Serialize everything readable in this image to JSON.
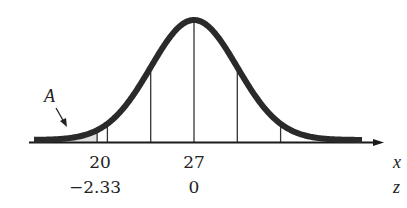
{
  "diagram": {
    "type": "normal-distribution",
    "mean_x": 27,
    "shaded_area_label": "A",
    "axis_variables": {
      "x": "x",
      "z": "z"
    },
    "x_labels": [
      {
        "x_value": "20",
        "z_value": "−2.33"
      },
      {
        "x_value": "27",
        "z_value": "0"
      }
    ],
    "reference_lines_sigma": [
      -2.33,
      -2,
      -1,
      0,
      1,
      2
    ],
    "colors": {
      "curve": "#2a2a2a",
      "shade": "#e2e2e2",
      "axis": "#1a1a1a"
    }
  },
  "chart_data": {
    "type": "area",
    "title": "",
    "xlabel": "x",
    "secondary_xlabel": "z",
    "ticks": [
      {
        "x": 20,
        "z": -2.33
      },
      {
        "x": 27,
        "z": 0
      }
    ],
    "shaded_region": {
      "label": "A",
      "from": "-inf",
      "to_x": 20,
      "to_z": -2.33
    },
    "vertical_lines_z": [
      -2.33,
      -2,
      -1,
      0,
      1,
      2
    ]
  }
}
